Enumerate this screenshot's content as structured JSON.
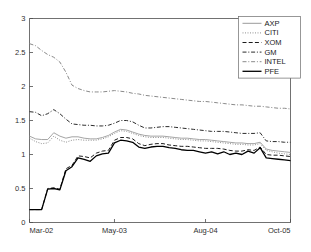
{
  "chart_data": {
    "type": "line",
    "title": "",
    "xlabel": "",
    "ylabel": "",
    "xlim": [
      0,
      43
    ],
    "ylim": [
      0,
      3
    ],
    "grid": false,
    "legend_position": "top-right",
    "yticks": [
      "0",
      "0.5",
      "1",
      "1.5",
      "2",
      "2.5",
      "3"
    ],
    "ytick_values": [
      0,
      0.5,
      1,
      1.5,
      2,
      2.5,
      3
    ],
    "xticks": [
      "Mar-02",
      "May-03",
      "Aug-04",
      "Oct-05"
    ],
    "xtick_values": [
      0,
      14,
      29,
      43
    ],
    "x": [
      0,
      1,
      2,
      3,
      4,
      5,
      6,
      7,
      8,
      9,
      10,
      11,
      12,
      13,
      14,
      15,
      16,
      17,
      18,
      19,
      20,
      21,
      22,
      23,
      24,
      25,
      26,
      27,
      28,
      29,
      30,
      31,
      32,
      33,
      34,
      35,
      36,
      37,
      38,
      39,
      40,
      41,
      42,
      43
    ],
    "series": [
      {
        "name": "AXP",
        "style": "solid",
        "color": "#9a9a9a",
        "width": 0.9,
        "values": [
          1.27,
          1.23,
          1.22,
          1.22,
          1.32,
          1.27,
          1.24,
          1.26,
          1.26,
          1.24,
          1.23,
          1.23,
          1.25,
          1.28,
          1.33,
          1.37,
          1.36,
          1.33,
          1.3,
          1.28,
          1.27,
          1.27,
          1.27,
          1.26,
          1.25,
          1.24,
          1.24,
          1.23,
          1.22,
          1.22,
          1.21,
          1.2,
          1.19,
          1.18,
          1.17,
          1.17,
          1.16,
          1.16,
          1.18,
          1.08,
          1.06,
          1.05,
          1.04,
          1.03
        ]
      },
      {
        "name": "CITI",
        "style": "dotted",
        "color": "#8f8f8f",
        "width": 1.0,
        "values": [
          1.24,
          1.19,
          1.16,
          1.17,
          1.27,
          1.21,
          1.18,
          1.21,
          1.22,
          1.21,
          1.21,
          1.21,
          1.23,
          1.26,
          1.31,
          1.35,
          1.34,
          1.31,
          1.28,
          1.26,
          1.25,
          1.25,
          1.25,
          1.24,
          1.23,
          1.22,
          1.22,
          1.21,
          1.2,
          1.2,
          1.19,
          1.18,
          1.17,
          1.16,
          1.15,
          1.15,
          1.14,
          1.14,
          1.16,
          1.06,
          1.04,
          1.02,
          1.01,
          1.0
        ]
      },
      {
        "name": "XOM",
        "style": "dashed",
        "color": "#1c1c1c",
        "width": 1.0,
        "values": [
          0.19,
          0.19,
          0.19,
          0.5,
          0.51,
          0.49,
          0.79,
          0.84,
          0.98,
          0.97,
          0.95,
          1.02,
          1.05,
          1.06,
          1.21,
          1.25,
          1.25,
          1.23,
          1.16,
          1.13,
          1.15,
          1.16,
          1.16,
          1.14,
          1.13,
          1.12,
          1.12,
          1.11,
          1.1,
          1.09,
          1.09,
          1.09,
          1.08,
          1.06,
          1.05,
          1.05,
          1.07,
          1.06,
          1.11,
          1.0,
          0.99,
          0.99,
          0.98,
          0.97
        ]
      },
      {
        "name": "GM",
        "style": "dashdot",
        "color": "#2b2b2b",
        "width": 1.0,
        "values": [
          1.63,
          1.62,
          1.57,
          1.6,
          1.66,
          1.6,
          1.52,
          1.45,
          1.44,
          1.43,
          1.43,
          1.42,
          1.42,
          1.43,
          1.46,
          1.5,
          1.5,
          1.48,
          1.43,
          1.39,
          1.39,
          1.4,
          1.41,
          1.41,
          1.4,
          1.39,
          1.38,
          1.37,
          1.36,
          1.35,
          1.34,
          1.34,
          1.34,
          1.33,
          1.32,
          1.31,
          1.31,
          1.31,
          1.32,
          1.2,
          1.19,
          1.19,
          1.18,
          1.18
        ]
      },
      {
        "name": "INTEL",
        "style": "dashdot",
        "color": "#8a8a8a",
        "width": 1.0,
        "values": [
          2.63,
          2.6,
          2.53,
          2.47,
          2.43,
          2.36,
          2.21,
          2.02,
          1.97,
          1.94,
          1.92,
          1.92,
          1.92,
          1.93,
          1.94,
          1.93,
          1.92,
          1.9,
          1.89,
          1.87,
          1.86,
          1.85,
          1.84,
          1.83,
          1.82,
          1.81,
          1.8,
          1.79,
          1.78,
          1.78,
          1.77,
          1.76,
          1.75,
          1.74,
          1.73,
          1.73,
          1.72,
          1.71,
          1.71,
          1.7,
          1.69,
          1.68,
          1.68,
          1.67
        ]
      },
      {
        "name": "PFE",
        "style": "solid",
        "color": "#000000",
        "width": 1.3,
        "values": [
          0.19,
          0.19,
          0.19,
          0.49,
          0.5,
          0.48,
          0.76,
          0.82,
          0.95,
          0.93,
          0.9,
          0.98,
          1.01,
          1.02,
          1.17,
          1.21,
          1.2,
          1.18,
          1.11,
          1.09,
          1.11,
          1.12,
          1.12,
          1.1,
          1.09,
          1.07,
          1.06,
          1.06,
          1.04,
          1.02,
          1.04,
          1.01,
          1.04,
          1.0,
          1.02,
          1.0,
          1.05,
          1.02,
          1.1,
          0.95,
          0.94,
          0.93,
          0.92,
          0.91
        ]
      }
    ],
    "legend": [
      {
        "label": "AXP",
        "style": "solid",
        "color": "#9a9a9a"
      },
      {
        "label": "CITI",
        "style": "dotted",
        "color": "#8f8f8f"
      },
      {
        "label": "XOM",
        "style": "dashed",
        "color": "#1c1c1c"
      },
      {
        "label": "GM",
        "style": "dashdot",
        "color": "#2b2b2b"
      },
      {
        "label": "INTEL",
        "style": "dashdot",
        "color": "#8a8a8a"
      },
      {
        "label": "PFE",
        "style": "solid",
        "color": "#000000"
      }
    ]
  }
}
